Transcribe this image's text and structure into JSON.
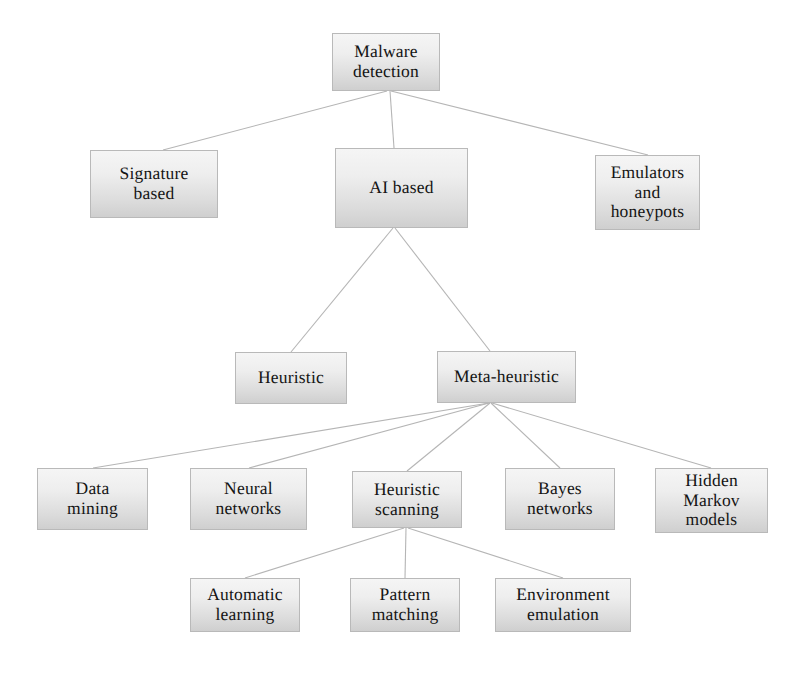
{
  "diagram": {
    "type": "tree",
    "style": {
      "box_border_color": "#b9b9b9",
      "box_fill_top": "#f5f5f5",
      "box_fill_bottom": "#cfcfcf",
      "edge_color": "#b5b5b5",
      "text_color": "#141414",
      "background": "#ffffff"
    },
    "nodes": [
      {
        "id": "malware_detection",
        "label": "Malware\ndetection",
        "level": 0,
        "x": 332,
        "y": 33,
        "w": 108,
        "h": 58
      },
      {
        "id": "signature_based",
        "label": "Signature\nbased",
        "level": 1,
        "x": 90,
        "y": 150,
        "w": 128,
        "h": 68
      },
      {
        "id": "ai_based",
        "label": "AI based",
        "level": 1,
        "x": 335,
        "y": 148,
        "w": 133,
        "h": 80
      },
      {
        "id": "emulators_and_honeypots",
        "label": "Emulators\nand\nhoneypots",
        "level": 1,
        "x": 595,
        "y": 155,
        "w": 105,
        "h": 75
      },
      {
        "id": "heuristic",
        "label": "Heuristic",
        "level": 2,
        "x": 235,
        "y": 352,
        "w": 112,
        "h": 52
      },
      {
        "id": "meta_heuristic",
        "label": "Meta-heuristic",
        "level": 2,
        "x": 437,
        "y": 351,
        "w": 139,
        "h": 52
      },
      {
        "id": "data_mining",
        "label": "Data\nmining",
        "level": 3,
        "x": 37,
        "y": 468,
        "w": 111,
        "h": 62
      },
      {
        "id": "neural_networks",
        "label": "Neural\nnetworks",
        "level": 3,
        "x": 190,
        "y": 468,
        "w": 117,
        "h": 62
      },
      {
        "id": "heuristic_scanning",
        "label": "Heuristic\nscanning",
        "level": 3,
        "x": 352,
        "y": 471,
        "w": 110,
        "h": 57
      },
      {
        "id": "bayes_networks",
        "label": "Bayes\nnetworks",
        "level": 3,
        "x": 505,
        "y": 468,
        "w": 110,
        "h": 62
      },
      {
        "id": "hidden_markov_models",
        "label": "Hidden\nMarkov\nmodels",
        "level": 3,
        "x": 655,
        "y": 468,
        "w": 113,
        "h": 65
      },
      {
        "id": "automatic_learning",
        "label": "Automatic\nlearning",
        "level": 4,
        "x": 190,
        "y": 578,
        "w": 110,
        "h": 54
      },
      {
        "id": "pattern_matching",
        "label": "Pattern\nmatching",
        "level": 4,
        "x": 350,
        "y": 578,
        "w": 110,
        "h": 54
      },
      {
        "id": "environment_emulation",
        "label": "Environment\nemulation",
        "level": 4,
        "x": 495,
        "y": 578,
        "w": 136,
        "h": 54
      }
    ],
    "edges": [
      {
        "from": "malware_detection",
        "to": "signature_based",
        "x1": 387,
        "y1": 91,
        "x2": 163,
        "y2": 150
      },
      {
        "from": "malware_detection",
        "to": "ai_based",
        "x1": 390,
        "y1": 91,
        "x2": 394,
        "y2": 148
      },
      {
        "from": "malware_detection",
        "to": "emulators_and_honeypots",
        "x1": 391,
        "y1": 91,
        "x2": 648,
        "y2": 155
      },
      {
        "from": "ai_based",
        "to": "heuristic",
        "x1": 393,
        "y1": 228,
        "x2": 291,
        "y2": 352
      },
      {
        "from": "ai_based",
        "to": "meta_heuristic",
        "x1": 395,
        "y1": 228,
        "x2": 490,
        "y2": 351
      },
      {
        "from": "meta_heuristic",
        "to": "data_mining",
        "x1": 489,
        "y1": 403,
        "x2": 93,
        "y2": 468
      },
      {
        "from": "meta_heuristic",
        "to": "neural_networks",
        "x1": 489,
        "y1": 403,
        "x2": 249,
        "y2": 468
      },
      {
        "from": "meta_heuristic",
        "to": "heuristic_scanning",
        "x1": 490,
        "y1": 403,
        "x2": 407,
        "y2": 471
      },
      {
        "from": "meta_heuristic",
        "to": "bayes_networks",
        "x1": 491,
        "y1": 403,
        "x2": 560,
        "y2": 468
      },
      {
        "from": "meta_heuristic",
        "to": "hidden_markov_models",
        "x1": 492,
        "y1": 403,
        "x2": 711,
        "y2": 468
      },
      {
        "from": "heuristic_scanning",
        "to": "automatic_learning",
        "x1": 404,
        "y1": 528,
        "x2": 245,
        "y2": 578
      },
      {
        "from": "heuristic_scanning",
        "to": "pattern_matching",
        "x1": 406,
        "y1": 528,
        "x2": 405,
        "y2": 578
      },
      {
        "from": "heuristic_scanning",
        "to": "environment_emulation",
        "x1": 408,
        "y1": 528,
        "x2": 563,
        "y2": 578
      }
    ]
  }
}
